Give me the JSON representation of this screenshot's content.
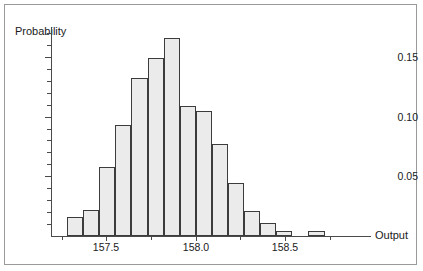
{
  "figure": {
    "background_color": "#ffffff",
    "frame_color": "#9a9a9a",
    "axis_color": "#4a4a4a",
    "bar_fill": "#ebebeb",
    "bar_stroke": "#3c3c3c"
  },
  "axis_titles": {
    "y": "Probability",
    "x": "Output"
  },
  "y_ticks": [
    {
      "value": 0.05,
      "label": "0.05"
    },
    {
      "value": 0.1,
      "label": "0.10"
    },
    {
      "value": 0.15,
      "label": "0.15"
    }
  ],
  "y_minor_ticks": [
    0.01,
    0.02,
    0.03,
    0.04,
    0.06,
    0.07,
    0.08,
    0.09,
    0.11,
    0.12,
    0.13,
    0.14,
    0.16,
    0.17
  ],
  "x_ticks": [
    {
      "value": 157.5,
      "label": "157.5"
    },
    {
      "value": 158.0,
      "label": "158.0"
    },
    {
      "value": 158.5,
      "label": "158.5"
    }
  ],
  "chart_data": {
    "type": "bar",
    "title": "",
    "subtitle": "",
    "xlabel": "Output",
    "ylabel": "Probability",
    "xlim": [
      157.19,
      158.98
    ],
    "ylim": [
      0.0,
      0.175
    ],
    "grid": false,
    "legend": null,
    "bin_width": 0.09,
    "bin_left_edges": [
      157.19,
      157.28,
      157.37,
      157.46,
      157.55,
      157.64,
      157.73,
      157.82,
      157.91,
      158.0,
      158.09,
      158.18,
      158.27,
      158.36,
      158.45,
      158.54,
      158.63,
      158.72,
      158.81
    ],
    "bin_centers": [
      157.235,
      157.325,
      157.415,
      157.505,
      157.595,
      157.685,
      157.775,
      157.865,
      157.955,
      158.045,
      158.135,
      158.225,
      158.315,
      158.405,
      158.495,
      158.585,
      158.675,
      158.765,
      158.855
    ],
    "categories": [
      "157.19-157.28",
      "157.28-157.37",
      "157.37-157.46",
      "157.46-157.55",
      "157.55-157.64",
      "157.64-157.73",
      "157.73-157.82",
      "157.82-157.91",
      "157.91-158.00",
      "158.00-158.09",
      "158.09-158.18",
      "158.18-158.27",
      "158.27-158.36",
      "158.36-158.45",
      "158.45-158.54",
      "158.54-158.63",
      "158.63-158.72",
      "158.72-158.81",
      "158.81-158.90"
    ],
    "values": [
      0.0,
      0.016,
      0.022,
      0.058,
      0.093,
      0.132,
      0.149,
      0.166,
      0.109,
      0.105,
      0.077,
      0.044,
      0.021,
      0.011,
      0.004,
      0.0,
      0.004,
      0.0,
      0.0
    ],
    "peak": {
      "value": 0.166,
      "center": 157.865
    }
  }
}
